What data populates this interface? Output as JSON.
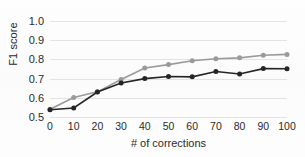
{
  "chart_data": {
    "type": "line",
    "title": "",
    "xlabel": "# of corrections",
    "ylabel": "F1 score",
    "x": [
      0,
      10,
      20,
      30,
      40,
      50,
      60,
      70,
      80,
      90,
      100
    ],
    "xticks": [
      "0",
      "10",
      "20",
      "30",
      "40",
      "50",
      "60",
      "70",
      "80",
      "90",
      "100"
    ],
    "yticks": [
      "0.5",
      "0.6",
      "0.7",
      "0.8",
      "0.9",
      "1.0"
    ],
    "ytick_values": [
      0.5,
      0.6,
      0.7,
      0.8,
      0.9,
      1.0
    ],
    "xlim": [
      0,
      100
    ],
    "ylim": [
      0.5,
      1.0
    ],
    "grid": "horizontal",
    "legend": "none",
    "series": [
      {
        "name": "upper-series",
        "color": "#9a9a9a",
        "marker": "circle",
        "values": [
          0.54,
          0.602,
          0.631,
          0.695,
          0.755,
          0.773,
          0.793,
          0.803,
          0.808,
          0.822,
          0.826
        ]
      },
      {
        "name": "lower-series",
        "color": "#252525",
        "marker": "circle",
        "values": [
          0.538,
          0.547,
          0.63,
          0.677,
          0.7,
          0.711,
          0.709,
          0.737,
          0.724,
          0.752,
          0.751
        ]
      }
    ]
  }
}
